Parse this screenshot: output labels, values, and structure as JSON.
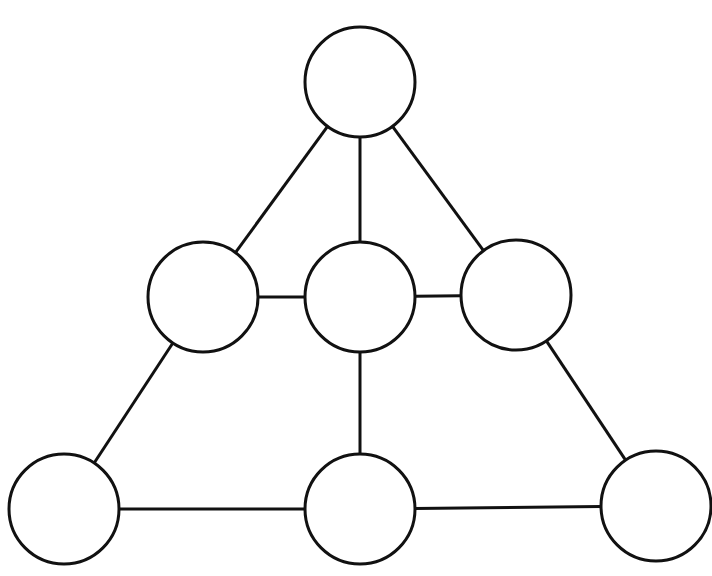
{
  "diagram": {
    "width": 712,
    "height": 576,
    "background": "#ffffff",
    "stroke_color": "#111111",
    "stroke_width": 3,
    "node_fill": "#ffffff",
    "nodes": [
      {
        "id": "top",
        "cx": 360,
        "cy": 82,
        "r": 55,
        "label": ""
      },
      {
        "id": "mid-left",
        "cx": 203,
        "cy": 297,
        "r": 55,
        "label": ""
      },
      {
        "id": "mid-center",
        "cx": 360,
        "cy": 297,
        "r": 55,
        "label": ""
      },
      {
        "id": "mid-right",
        "cx": 516,
        "cy": 295,
        "r": 55,
        "label": ""
      },
      {
        "id": "bottom-left",
        "cx": 64,
        "cy": 509,
        "r": 55,
        "label": ""
      },
      {
        "id": "bottom-center",
        "cx": 360,
        "cy": 509,
        "r": 55,
        "label": ""
      },
      {
        "id": "bottom-right",
        "cx": 656,
        "cy": 506,
        "r": 55,
        "label": ""
      }
    ],
    "edges": [
      [
        "top",
        "mid-left"
      ],
      [
        "top",
        "mid-center"
      ],
      [
        "top",
        "mid-right"
      ],
      [
        "mid-left",
        "mid-center"
      ],
      [
        "mid-center",
        "mid-right"
      ],
      [
        "mid-left",
        "bottom-left"
      ],
      [
        "mid-center",
        "bottom-center"
      ],
      [
        "mid-right",
        "bottom-right"
      ],
      [
        "bottom-left",
        "bottom-center"
      ],
      [
        "bottom-center",
        "bottom-right"
      ]
    ]
  }
}
